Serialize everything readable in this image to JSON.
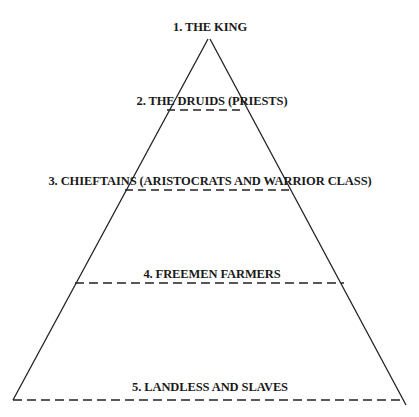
{
  "diagram": {
    "levels": [
      {
        "rank": 1,
        "label": "1. THE KING"
      },
      {
        "rank": 2,
        "label": "2. THE DRUIDS (PRIESTS)"
      },
      {
        "rank": 3,
        "label": "3. CHIEFTAINS (ARISTOCRATS AND WARRIOR CLASS)"
      },
      {
        "rank": 4,
        "label": "4. FREEMEN FARMERS"
      },
      {
        "rank": 5,
        "label": "5. LANDLESS AND SLAVES"
      }
    ],
    "colors": {
      "line": "#222222",
      "text": "#1a1a1a",
      "background": "#ffffff"
    }
  }
}
